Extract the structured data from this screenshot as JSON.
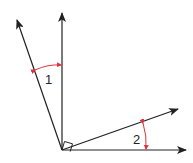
{
  "diagram": {
    "title": "",
    "labels": {
      "angle1": "1",
      "angle2": "2"
    },
    "colors": {
      "ray": "#222222",
      "arc": "#e0323a",
      "background": "#ffffff"
    },
    "elements": {
      "rays": [
        "left-ray",
        "vertical-ray",
        "upper-right-ray",
        "horizontal-ray"
      ],
      "right_angle_marker": "between left-ray and upper-right-ray at vertex",
      "angle_1": "between left-ray and vertical-ray",
      "angle_2": "between horizontal-ray and upper-right-ray"
    }
  }
}
